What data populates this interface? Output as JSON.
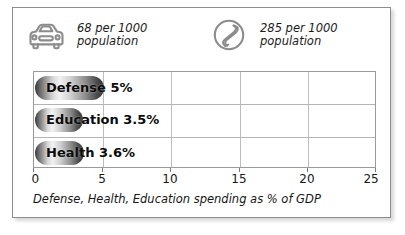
{
  "card": {
    "accent_color": "#3a3a3a",
    "border_color": "#8d8d8d"
  },
  "stats": [
    {
      "icon": "car-icon",
      "value_line": "68 per 1000",
      "unit_line": "population"
    },
    {
      "icon": "telephone-icon",
      "value_line": "285 per 1000",
      "unit_line": "population"
    }
  ],
  "chart_data": {
    "type": "bar",
    "orientation": "horizontal",
    "title": "",
    "categories": [
      "Defense",
      "Education",
      "Health"
    ],
    "values": [
      5,
      3.5,
      3.6
    ],
    "bar_labels": [
      "Defense 5%",
      "Education 3.5%",
      "Health 3.6%"
    ],
    "xlabel": "Defense, Health, Education spending as % of GDP",
    "ylabel": "",
    "xlim": [
      0,
      25
    ],
    "xticks": [
      0,
      5,
      10,
      15,
      20,
      25
    ],
    "xtick_labels": [
      "0",
      "5",
      "10",
      "15",
      "20",
      "25"
    ],
    "grid": true,
    "legend": "none"
  }
}
